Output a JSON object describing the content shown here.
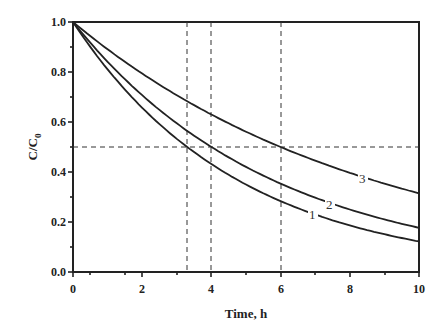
{
  "chart_data": {
    "type": "line",
    "title": "",
    "xlabel": "Time, h",
    "ylabel": "C/C0",
    "xlim": [
      0,
      10
    ],
    "ylim": [
      0,
      1.0
    ],
    "xticks": [
      "0",
      "2",
      "4",
      "6",
      "8",
      "10"
    ],
    "yticks": [
      "0.0",
      "0.2",
      "0.4",
      "0.6",
      "0.8",
      "1.0"
    ],
    "grid": false,
    "legend": "inline curve labels",
    "x": [
      0,
      1,
      2,
      3,
      4,
      5,
      6,
      7,
      8,
      9,
      10
    ],
    "series": [
      {
        "name": "1",
        "half_life_h": 3.3,
        "values": [
          1.0,
          0.81,
          0.66,
          0.53,
          0.43,
          0.35,
          0.28,
          0.23,
          0.19,
          0.15,
          0.12
        ]
      },
      {
        "name": "2",
        "half_life_h": 4.0,
        "values": [
          1.0,
          0.84,
          0.71,
          0.59,
          0.5,
          0.42,
          0.35,
          0.3,
          0.25,
          0.21,
          0.18
        ]
      },
      {
        "name": "3",
        "half_life_h": 6.0,
        "values": [
          1.0,
          0.89,
          0.79,
          0.71,
          0.63,
          0.56,
          0.5,
          0.45,
          0.4,
          0.35,
          0.31
        ]
      }
    ],
    "reference_lines": {
      "horizontal": [
        0.5
      ],
      "vertical": [
        3.3,
        4.0,
        6.0
      ],
      "style": "dashed"
    }
  },
  "labels": {
    "xlabel": "Time, h",
    "ylabel_main": "C/C",
    "ylabel_sub": "0",
    "curve1": "1",
    "curve2": "2",
    "curve3": "3",
    "xt0": "0",
    "xt2": "2",
    "xt4": "4",
    "xt6": "6",
    "xt8": "8",
    "xt10": "10",
    "yt0": "0.0",
    "yt2": "0.2",
    "yt4": "0.4",
    "yt6": "0.6",
    "yt8": "0.8",
    "yt10": "1.0"
  }
}
